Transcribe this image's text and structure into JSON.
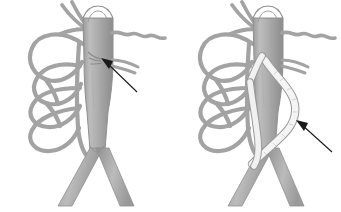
{
  "figure": {
    "background_color": "#ffffff",
    "width": 341,
    "height": 212,
    "caption": ""
  },
  "palette": {
    "vessel_fill": "#a6a6a6",
    "vessel_fill_light": "#c2c2c2",
    "vessel_fill_dark": "#8a8a8a",
    "vessel_outline": "#8f8f8f",
    "catheter_fill": "#f4f4f4",
    "catheter_outline": "#9a9a9a",
    "arrow_color": "#1a1a1a",
    "background": "#ffffff"
  },
  "panels": [
    {
      "id": "left",
      "label": "panel-left",
      "description": "Baseline anatomy: main trunk vessel with bifurcation, looping collateral arcade on the left, serpentine branch to the right, arrow indicating the vessel ostium.",
      "parts": {
        "main_trunk_label": "main-trunk-vessel",
        "bifurcation_label": "bifurcation",
        "collateral_arcade_label": "collateral-vessel-arcade",
        "serpentine_branch_label": "serpentine-branch-vessel",
        "top_crossing_branch_label": "top-crossing-branch",
        "ostium_label": "vessel-ostium"
      },
      "annotation": {
        "type": "arrow",
        "points_to": "vessel-ostium",
        "tail": {
          "x": 137,
          "y": 92
        },
        "head": {
          "x": 101,
          "y": 58
        },
        "text": ""
      }
    },
    {
      "id": "right",
      "label": "panel-right",
      "description": "Post-intervention: identical anatomy with a pale catheter/graft conduit looping out of the trunk, down and around, with its tip near the bifurcation; arrow indicating the conduit.",
      "parts": {
        "main_trunk_label": "main-trunk-vessel",
        "bifurcation_label": "bifurcation",
        "collateral_arcade_label": "collateral-vessel-arcade",
        "serpentine_branch_label": "serpentine-branch-vessel",
        "top_crossing_branch_label": "top-crossing-branch",
        "catheter_label": "catheter-graft-conduit"
      },
      "annotation": {
        "type": "arrow",
        "points_to": "catheter-graft-conduit",
        "tail": {
          "x": 332,
          "y": 152
        },
        "head": {
          "x": 296,
          "y": 120
        },
        "text": ""
      }
    }
  ]
}
